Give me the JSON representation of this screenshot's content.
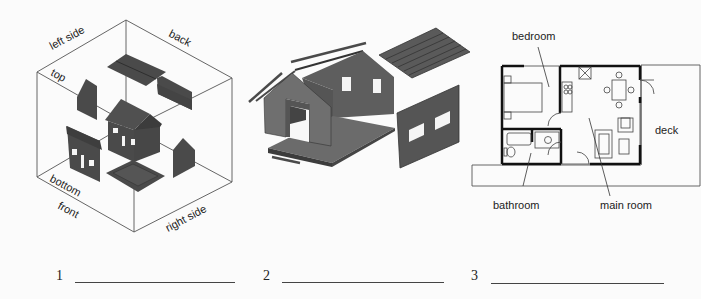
{
  "figure_1": {
    "title": "exploded orthographic cube",
    "labels": {
      "left_side": "left side",
      "back": "back",
      "top": "top",
      "bottom": "bottom",
      "front": "front",
      "right_side": "right side"
    }
  },
  "figure_2": {
    "title": "exploded house model"
  },
  "figure_3": {
    "title": "floor plan",
    "labels": {
      "bedroom": "bedroom",
      "bathroom": "bathroom",
      "main_room": "main room",
      "deck": "deck"
    }
  },
  "answers": [
    {
      "number": "1",
      "value": ""
    },
    {
      "number": "2",
      "value": ""
    },
    {
      "number": "3",
      "value": ""
    }
  ],
  "colors": {
    "panel": "#4a4a4a",
    "panel_light": "#6e6e6e",
    "line": "#555555",
    "wall": "#111111"
  }
}
